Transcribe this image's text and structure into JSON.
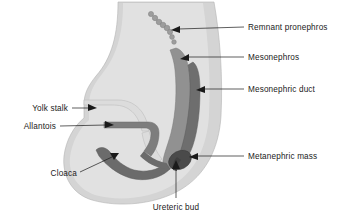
{
  "figure": {
    "background_color": "#ffffff"
  },
  "palette": {
    "body_outline": "#d4d4d4",
    "body_inner_pale": "#e6e6e6",
    "mesonephros": "#919191",
    "mesonephric_duct": "#6e6e6e",
    "allantois": "#7d7d7d",
    "cloaca": "#6b6b6b",
    "metanephric_mass": "#4a4a4a",
    "pronephros_dot": "#9a9a9a",
    "yolk_stalk": "#dadada",
    "stroke": "#8a8a8a",
    "label_color": "#1a1a1a",
    "leader_color": "#1a1a1a"
  },
  "labels": {
    "remnant_pronephros": "Remnant pronephros",
    "mesonephros": "Mesonephros",
    "mesonephric_duct": "Mesonephric duct",
    "metanephric_mass": "Metanephric mass",
    "yolk_stalk": "Yolk stalk",
    "allantois": "Allantois",
    "cloaca": "Cloaca",
    "ureteric_bud": "Ureteric bud"
  },
  "structures": [
    {
      "id": "body",
      "name": "embryo-body",
      "label": ""
    },
    {
      "id": "pronephros",
      "name": "remnant-pronephros",
      "label": "Remnant pronephros",
      "dot_count": 8
    },
    {
      "id": "mesonephros",
      "name": "mesonephros",
      "label": "Mesonephros"
    },
    {
      "id": "mesonephric-duct",
      "name": "mesonephric-duct",
      "label": "Mesonephric duct"
    },
    {
      "id": "metanephric-mass",
      "name": "metanephric-mass",
      "label": "Metanephric mass"
    },
    {
      "id": "yolk-stalk",
      "name": "yolk-stalk",
      "label": "Yolk stalk"
    },
    {
      "id": "allantois",
      "name": "allantois",
      "label": "Allantois"
    },
    {
      "id": "cloaca",
      "name": "cloaca",
      "label": "Cloaca"
    },
    {
      "id": "ureteric-bud",
      "name": "ureteric-bud",
      "label": "Ureteric bud"
    }
  ]
}
